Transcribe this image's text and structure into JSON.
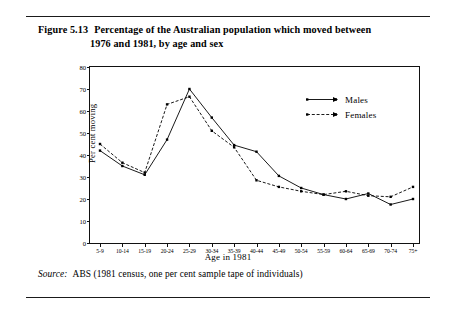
{
  "figure": {
    "number": "Figure 5.13",
    "title_line1": "Percentage of the Australian population which moved between",
    "title_line2": "1976 and 1981, by age and sex",
    "source_keyword": "Source:",
    "source_text": "ABS (1981 census, one per cent sample tape of individuals)"
  },
  "legend": {
    "items": [
      {
        "label": "Males",
        "style": "solid",
        "color": "#000000"
      },
      {
        "label": "Females",
        "style": "dashed",
        "color": "#000000"
      }
    ]
  },
  "chart_data": {
    "type": "line",
    "title": "Percentage of the Australian population which moved between 1976 and 1981, by age and sex",
    "xlabel": "Age in 1981",
    "ylabel": "Per cent moving",
    "categories": [
      "5-9",
      "10-14",
      "15-19",
      "20-24",
      "25-29",
      "30-34",
      "35-39",
      "40-44",
      "45-49",
      "50-54",
      "55-59",
      "60-64",
      "65-69",
      "70-74",
      "75+"
    ],
    "series": [
      {
        "name": "Males",
        "style": "solid",
        "values": [
          42,
          35,
          31,
          47,
          70,
          57,
          44.5,
          41.5,
          30.5,
          25,
          22,
          20,
          22.5,
          17.5,
          20
        ]
      },
      {
        "name": "Females",
        "style": "dashed",
        "values": [
          45,
          36.5,
          32,
          63,
          66.5,
          51,
          43.5,
          28.5,
          25.5,
          23.5,
          22,
          23.5,
          21.5,
          21,
          25.5
        ]
      }
    ],
    "ylim": [
      0,
      80
    ],
    "yticks": [
      0,
      10,
      20,
      30,
      40,
      50,
      60,
      70,
      80
    ],
    "grid": false,
    "legend_position": "top-right"
  }
}
